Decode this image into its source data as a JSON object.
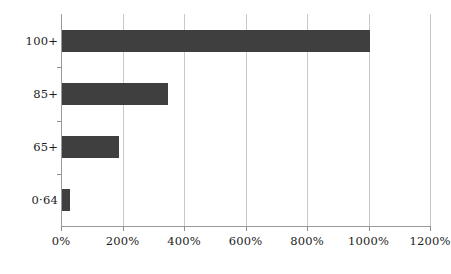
{
  "chart_data": {
    "type": "bar",
    "orientation": "horizontal",
    "title": "",
    "subtitle": "",
    "xlabel": "",
    "ylabel": "",
    "categories": [
      "0-64",
      "65+",
      "85+",
      "100+"
    ],
    "values": [
      25,
      185,
      345,
      1000
    ],
    "value_unit": "%",
    "xlim": [
      0,
      1200
    ],
    "xticks": [
      0,
      200,
      400,
      600,
      800,
      1000,
      1200
    ],
    "xtick_labels": [
      "0%",
      "200%",
      "400%",
      "600%",
      "800%",
      "1000%",
      "1200%"
    ],
    "ytick_labels": [
      "0·64",
      "65+",
      "85+",
      "100+"
    ],
    "grid": "vertical",
    "legend": "none",
    "bar_color": "#3f3f3f",
    "gridline_color": "#c9c9c9",
    "axis_color": "#9a9a9a",
    "background_color": "#ffffff",
    "series": [
      {
        "name": "",
        "points": [
          {
            "category": "100+",
            "label": "100+",
            "value": 1000
          },
          {
            "category": "85+",
            "label": "85+",
            "value": 345
          },
          {
            "category": "65+",
            "label": "65+",
            "value": 185
          },
          {
            "category": "0-64",
            "label": "0·64",
            "value": 25
          }
        ]
      }
    ]
  }
}
